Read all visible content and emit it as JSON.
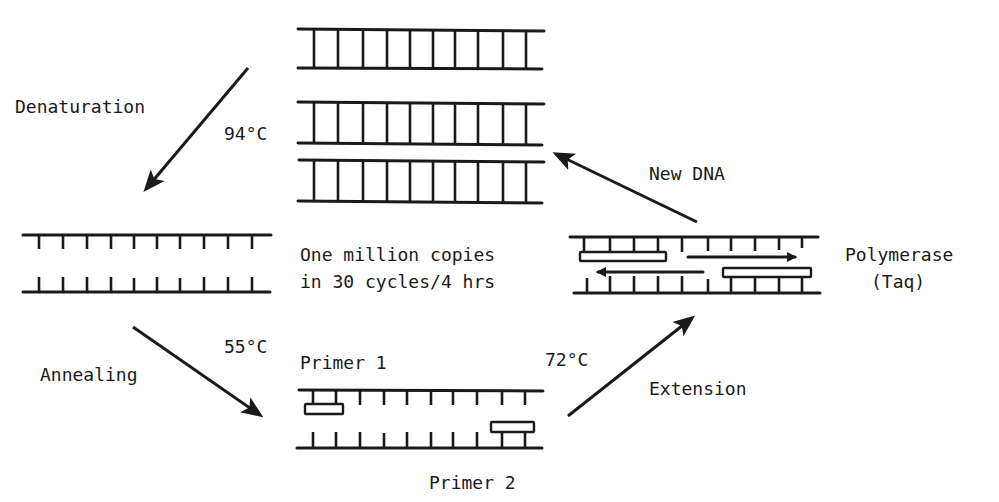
{
  "diagram": {
    "colors": {
      "ink": "#1a1a1a",
      "background": "#ffffff"
    },
    "steps": {
      "denaturation": {
        "label": "Denaturation",
        "temperature": "94°C"
      },
      "annealing": {
        "label": "Annealing",
        "temperature": "55°C"
      },
      "extension": {
        "label": "Extension",
        "temperature": "72°C"
      },
      "new_dna": {
        "label": "New DNA"
      }
    },
    "center_note": {
      "line1": "One million copies",
      "line2": "in 30 cycles/4 hrs"
    },
    "annealing_stage": {
      "primer1": "Primer 1",
      "primer2": "Primer 2"
    },
    "polymerase": {
      "line1": "Polymerase",
      "line2": "(Taq)"
    },
    "structures": {
      "double_stranded_copies": 3,
      "rungs_per_strand": 10
    }
  }
}
